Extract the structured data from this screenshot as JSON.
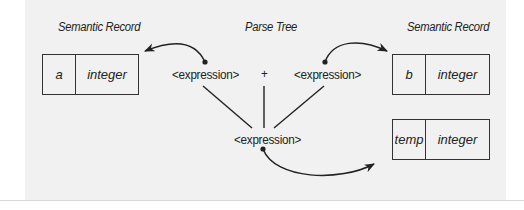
{
  "diagram": {
    "headings": {
      "left": "Semantic Record",
      "center": "Parse Tree",
      "right": "Semantic Record"
    },
    "parse_tree": {
      "left_operand": "<expression>",
      "operator": "+",
      "right_operand": "<expression>",
      "result": "<expression>"
    },
    "records": [
      {
        "id": "a",
        "name": "a",
        "type": "integer"
      },
      {
        "id": "b",
        "name": "b",
        "type": "integer"
      },
      {
        "id": "temp",
        "name": "temp",
        "type": "integer"
      }
    ],
    "colors": {
      "panel": "#f1f1f1",
      "ink": "#222222"
    }
  }
}
